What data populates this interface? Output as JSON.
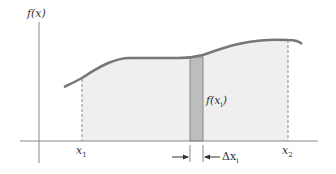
{
  "figure": {
    "type": "riemann-sum-rectangle-diagram",
    "y_axis_label": "f(x)",
    "x_left_label": "x",
    "x_left_sub": "1",
    "x_right_label": "x",
    "x_right_sub": "2",
    "rect_height_label": "f(x",
    "rect_height_sub": "i",
    "rect_height_close": ")",
    "width_label": "Δx",
    "width_sub": "i"
  },
  "colors": {
    "curve": "#777777",
    "region_fill": "#efefef",
    "rect_fill": "#bdbdbd",
    "rect_stroke": "#888888",
    "axis": "#888888",
    "text": "#333333"
  }
}
